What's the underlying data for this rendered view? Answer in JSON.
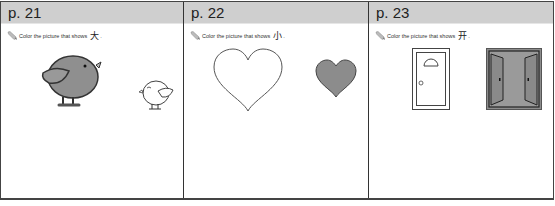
{
  "pages": [
    {
      "label": "p. 21",
      "instruction": "Color the picture that shows",
      "character": "大",
      "punct": ".",
      "pictures": [
        {
          "name": "big-bird",
          "fill": "#909090",
          "size": "large"
        },
        {
          "name": "small-bird",
          "fill": "#ffffff",
          "size": "small"
        }
      ]
    },
    {
      "label": "p. 22",
      "instruction": "Color the picture that shows",
      "character": "小",
      "punct": ".",
      "pictures": [
        {
          "name": "big-heart",
          "fill": "#ffffff",
          "size": "large"
        },
        {
          "name": "small-heart",
          "fill": "#8c8c8c",
          "size": "small"
        }
      ]
    },
    {
      "label": "p. 23",
      "instruction": "Color the picture that shows",
      "character": "开",
      "punct": ".",
      "pictures": [
        {
          "name": "closed-door",
          "fill": "#ffffff",
          "state": "closed"
        },
        {
          "name": "open-door",
          "fill": "#8c8c8c",
          "state": "open"
        }
      ]
    }
  ],
  "colors": {
    "header_bg": "#cfcfcf",
    "border": "#333333",
    "shape_fill": "#8c8c8c"
  }
}
